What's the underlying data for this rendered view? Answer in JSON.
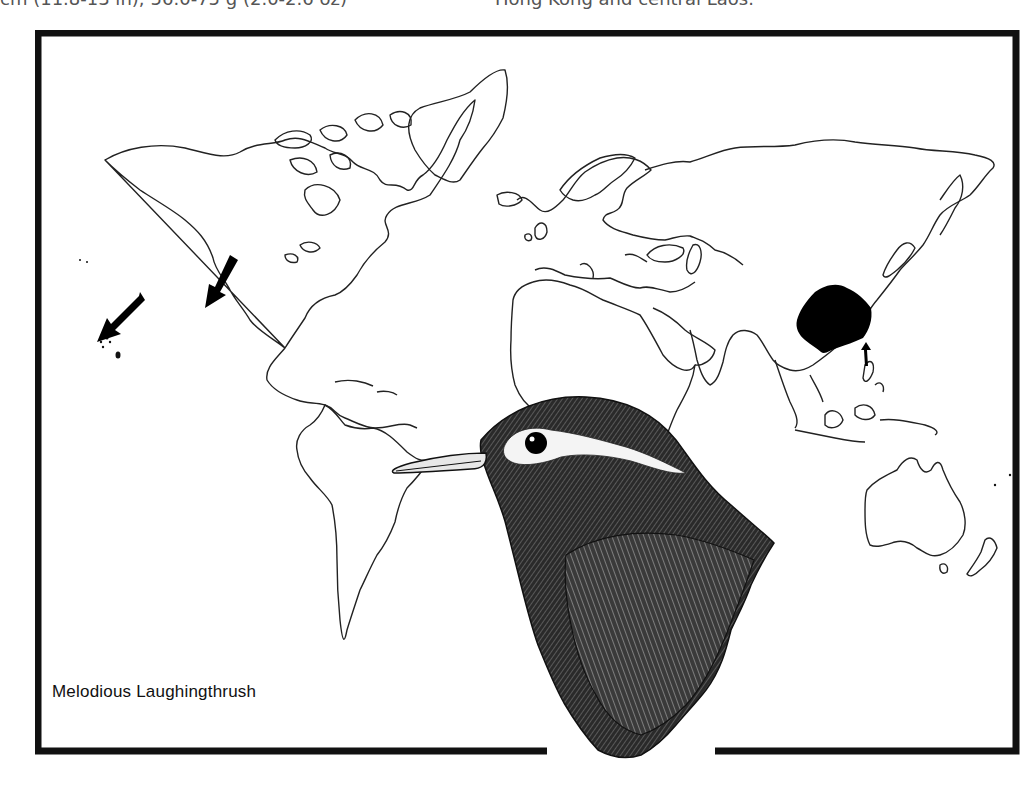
{
  "page": {
    "header_fragments": [
      {
        "text": "cm (11.8-13 in); 56.0-75 g (2.0-2.6 oz)",
        "x": 0
      },
      {
        "text": "Hong Kong and central Laos.",
        "x": 495
      }
    ]
  },
  "map": {
    "title": "Melodious Laughingthrush",
    "frame_color": "#111111",
    "land_outline_color": "#222222",
    "range_fill_color": "#000000",
    "range_region": "Southern and central China (native range)",
    "introduced_markers": [
      {
        "name": "hawaii-arrow",
        "label": "Hawaii (introduced)"
      },
      {
        "name": "california-arrow",
        "label": "Western North America (introduced)"
      },
      {
        "name": "taiwan-arrow",
        "label": "Taiwan/Hainan pointer"
      }
    ]
  },
  "illustration": {
    "subject": "Melodious Laughingthrush head and breast",
    "style": "pen-and-ink engraving"
  }
}
